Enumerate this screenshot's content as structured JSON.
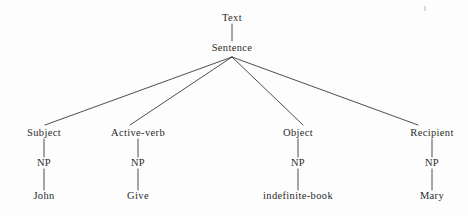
{
  "diagram": {
    "kind": "parse-tree",
    "title_text": "Text",
    "ink_color": "#2b2b2b",
    "background_color": "#fdfdfd",
    "root": {
      "label": "Text",
      "x": 232,
      "y": 18
    },
    "sentence": {
      "label": "Sentence",
      "x": 232,
      "y": 48
    },
    "branches": [
      {
        "role": "Subject",
        "role_x": 44,
        "role_y": 133,
        "np": "NP",
        "np_x": 44,
        "np_y": 163,
        "leaf": "John",
        "leaf_x": 44,
        "leaf_y": 196
      },
      {
        "role": "Active-verb",
        "role_x": 138,
        "role_y": 133,
        "np": "NP",
        "np_x": 138,
        "np_y": 163,
        "leaf": "Give",
        "leaf_x": 138,
        "leaf_y": 196
      },
      {
        "role": "Object",
        "role_x": 298,
        "role_y": 133,
        "np": "NP",
        "np_x": 298,
        "np_y": 163,
        "leaf": "indefinite-book",
        "leaf_x": 298,
        "leaf_y": 196
      },
      {
        "role": "Recipient",
        "role_x": 432,
        "role_y": 133,
        "np": "NP",
        "np_x": 432,
        "np_y": 163,
        "leaf": "Mary",
        "leaf_x": 432,
        "leaf_y": 196
      }
    ],
    "edges": {
      "trunk": {
        "x1": 232,
        "y1": 24,
        "x2": 232,
        "y2": 41
      },
      "fan_origin": {
        "x": 232,
        "y": 57
      },
      "fan_ends": [
        {
          "x": 45,
          "y": 125
        },
        {
          "x": 130,
          "y": 125
        },
        {
          "x": 303,
          "y": 125
        },
        {
          "x": 418,
          "y": 125
        }
      ],
      "stems": [
        {
          "x": 44,
          "y1": 139,
          "y2": 157
        },
        {
          "x": 44,
          "y1": 169,
          "y2": 190
        },
        {
          "x": 138,
          "y1": 139,
          "y2": 157
        },
        {
          "x": 138,
          "y1": 169,
          "y2": 190
        },
        {
          "x": 298,
          "y1": 139,
          "y2": 157
        },
        {
          "x": 298,
          "y1": 169,
          "y2": 190
        },
        {
          "x": 432,
          "y1": 139,
          "y2": 157
        },
        {
          "x": 432,
          "y1": 169,
          "y2": 190
        }
      ]
    }
  }
}
